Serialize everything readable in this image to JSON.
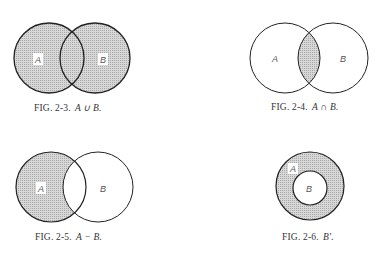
{
  "colors": {
    "outline": "#222222",
    "shade": "#d4d4d4",
    "shade_dot": "#9a9a9a",
    "background": "#ffffff",
    "text": "#333333"
  },
  "figures": [
    {
      "id": "fig-2-3",
      "caption_prefix": "FIG. 2-3.",
      "caption_expr": "A ∪ B.",
      "operation": "union",
      "labels": {
        "a": "A",
        "b": "B"
      },
      "shaded": "A and B"
    },
    {
      "id": "fig-2-4",
      "caption_prefix": "FIG. 2-4.",
      "caption_expr": "A ∩ B.",
      "operation": "intersection",
      "labels": {
        "a": "A",
        "b": "B"
      },
      "shaded": "overlap of A and B"
    },
    {
      "id": "fig-2-5",
      "caption_prefix": "FIG. 2-5.",
      "caption_expr": "A − B.",
      "operation": "difference",
      "labels": {
        "a": "A",
        "b": "B"
      },
      "shaded": "A excluding B"
    },
    {
      "id": "fig-2-6",
      "caption_prefix": "FIG. 2-6.",
      "caption_expr": "B′.",
      "operation": "complement",
      "labels": {
        "a": "A",
        "b": "B"
      },
      "shaded": "A outside B"
    }
  ]
}
